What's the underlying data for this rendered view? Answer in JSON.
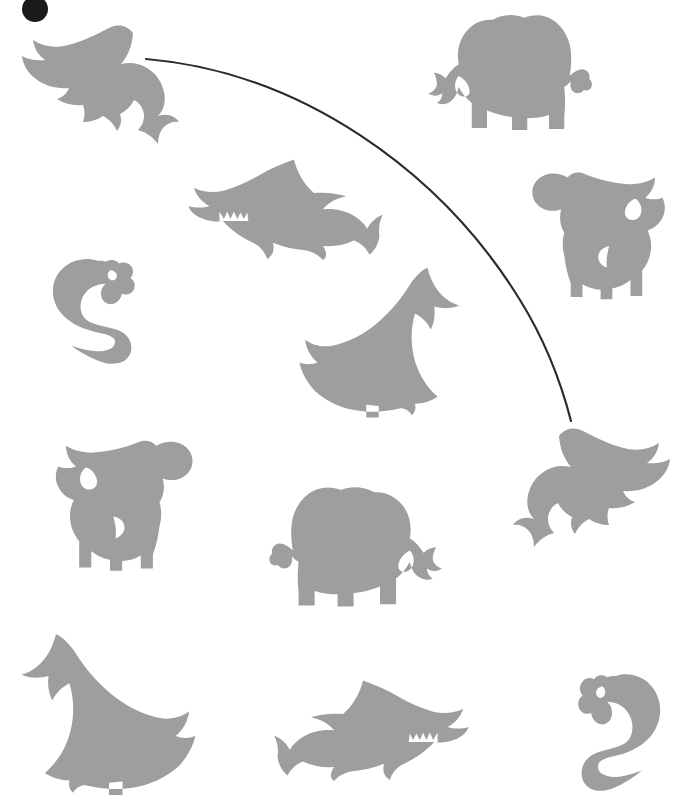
{
  "canvas": {
    "width": 695,
    "height": 807,
    "background_color": "#ffffff",
    "silhouette_color": "#9e9e9e",
    "line_color": "#2b2b2b"
  },
  "cursor": {
    "name": "pointer-dot",
    "color": "#1a1a1a",
    "x": 22,
    "y": -4,
    "diameter": 26
  },
  "connector_line": {
    "name": "matching-line",
    "color": "#2b2b2b",
    "stroke_width": 2.2,
    "from": {
      "x": 146,
      "y": 59,
      "anchor": "dolphin-top-left"
    },
    "to": {
      "x": 571,
      "y": 421,
      "anchor": "dolphin-middle-right"
    },
    "path": "M146,59 C300,72 440,170 520,300 C548,345 563,390 571,421"
  },
  "animals": [
    {
      "id": "dolphin-top-left",
      "label": "Dolphin",
      "shape": "dolphin",
      "facing": "left",
      "flipped": false,
      "x": 14,
      "y": 22,
      "width": 165,
      "height": 125
    },
    {
      "id": "elephant-top-right",
      "label": "Elephant",
      "shape": "elephant",
      "facing": "left",
      "flipped": false,
      "x": 413,
      "y": 8,
      "width": 185,
      "height": 135
    },
    {
      "id": "shark-upper-middle",
      "label": "Shark",
      "shape": "shark",
      "facing": "left",
      "flipped": false,
      "x": 185,
      "y": 152,
      "width": 200,
      "height": 108
    },
    {
      "id": "cow-upper-right",
      "label": "Cow",
      "shape": "cow",
      "facing": "right",
      "flipped": true,
      "x": 527,
      "y": 167,
      "width": 160,
      "height": 148
    },
    {
      "id": "snake-left",
      "label": "Snake",
      "shape": "snake",
      "facing": "right",
      "flipped": false,
      "x": 28,
      "y": 257,
      "width": 122,
      "height": 106
    },
    {
      "id": "whale-middle",
      "label": "Whale",
      "shape": "whale",
      "facing": "left",
      "flipped": false,
      "x": 296,
      "y": 262,
      "width": 170,
      "height": 160
    },
    {
      "id": "cow-middle-left",
      "label": "Cow",
      "shape": "cow",
      "facing": "left",
      "flipped": false,
      "x": 33,
      "y": 435,
      "width": 165,
      "height": 152
    },
    {
      "id": "elephant-bottom-middle",
      "label": "Elephant",
      "shape": "elephant",
      "facing": "right",
      "flipped": true,
      "x": 263,
      "y": 480,
      "width": 195,
      "height": 140
    },
    {
      "id": "dolphin-middle-right",
      "label": "Dolphin",
      "shape": "dolphin",
      "facing": "right",
      "flipped": true,
      "x": 513,
      "y": 425,
      "width": 165,
      "height": 125
    },
    {
      "id": "whale-bottom-left",
      "label": "Whale",
      "shape": "whale",
      "facing": "right",
      "flipped": true,
      "x": 14,
      "y": 628,
      "width": 185,
      "height": 172
    },
    {
      "id": "shark-bottom-middle",
      "label": "Shark",
      "shape": "shark",
      "facing": "right",
      "flipped": true,
      "x": 272,
      "y": 673,
      "width": 200,
      "height": 108
    },
    {
      "id": "snake-bottom-right",
      "label": "Snake",
      "shape": "snake",
      "facing": "left",
      "flipped": true,
      "x": 563,
      "y": 672,
      "width": 122,
      "height": 118
    }
  ]
}
